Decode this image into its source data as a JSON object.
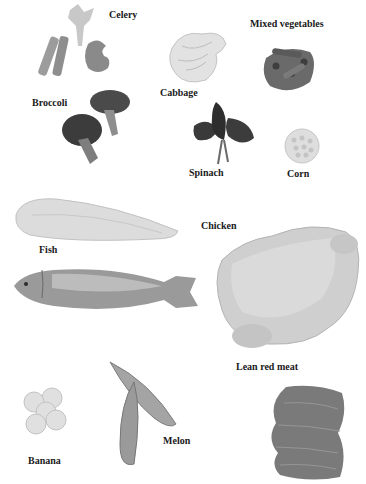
{
  "labels": {
    "celery": "Celery",
    "mixed_vegetables": "Mixed vegetables",
    "broccoli": "Broccoli",
    "cabbage": "Cabbage",
    "spinach": "Spinach",
    "corn": "Corn",
    "fish": "Fish",
    "chicken": "Chicken",
    "lean_red_meat": "Lean red meat",
    "banana": "Banana",
    "melon": "Melon"
  },
  "colors": {
    "background": "#ffffff",
    "text": "#1a1a1a",
    "light_food": "#d8d8d8",
    "mid_food": "#9a9a9a",
    "dark_food": "#4a4a4a"
  }
}
